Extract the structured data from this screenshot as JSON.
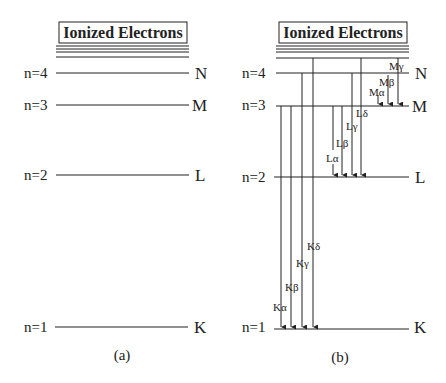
{
  "panel_a": {
    "caption": "(a)",
    "box_title": "Ionized Electrons",
    "levels": [
      {
        "n_label": "n=4",
        "shell": "N"
      },
      {
        "n_label": "n=3",
        "shell": "M"
      },
      {
        "n_label": "n=2",
        "shell": "L"
      },
      {
        "n_label": "n=1",
        "shell": "K"
      }
    ]
  },
  "panel_b": {
    "caption": "(b)",
    "box_title": "Ionized Electrons",
    "levels": [
      {
        "n_label": "n=4",
        "shell": "N"
      },
      {
        "n_label": "n=3",
        "shell": "M"
      },
      {
        "n_label": "n=2",
        "shell": "L"
      },
      {
        "n_label": "n=1",
        "shell": "K"
      }
    ],
    "transitions": {
      "K": [
        "Kα",
        "Kβ",
        "Kγ",
        "Kδ"
      ],
      "L": [
        "Lα",
        "Lβ",
        "Lγ",
        "Lδ"
      ],
      "M": [
        "Mα",
        "Mβ",
        "Mγ"
      ]
    }
  }
}
